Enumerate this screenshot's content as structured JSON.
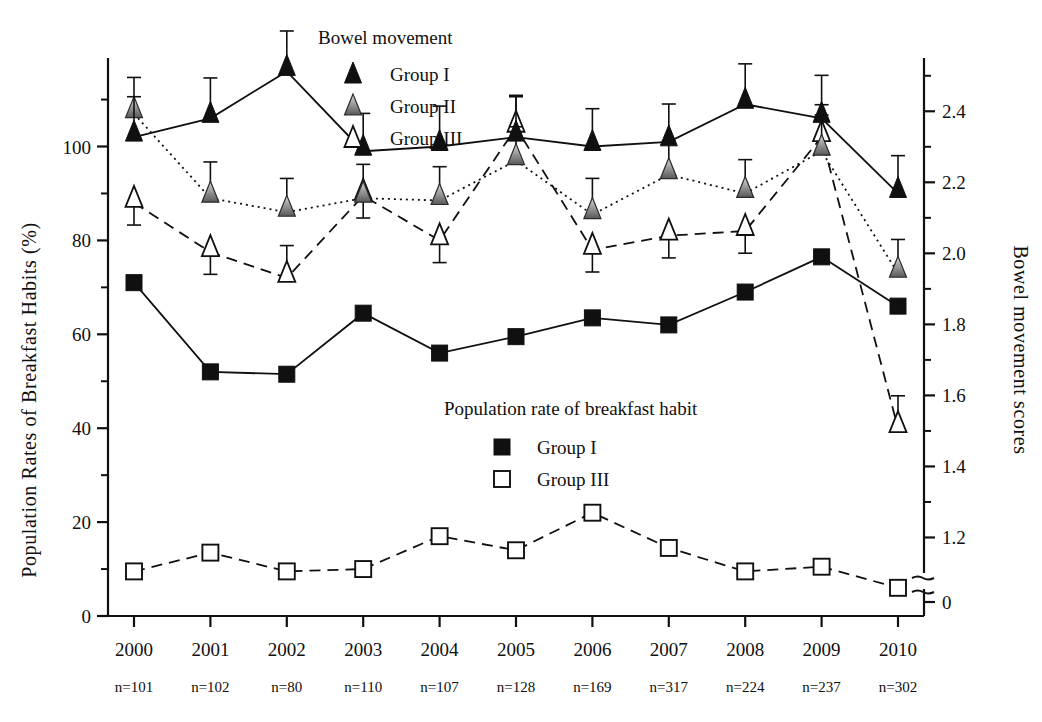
{
  "figure": {
    "y_axis_left_title": "Population Rates of Breakfast Habits (%)",
    "y_axis_right_title": "Bowel movement scores",
    "legend_top_title": "Bowel movement",
    "legend_bottom_title": "Population rate of breakfast habit"
  },
  "legend_top": [
    {
      "label": "Group I",
      "marker": "filled-triangle-icon"
    },
    {
      "label": "Group II",
      "marker": "gray-triangle-icon"
    },
    {
      "label": "Group III",
      "marker": "open-triangle-icon"
    }
  ],
  "legend_bottom": [
    {
      "label": "Group I",
      "marker": "filled-square-icon"
    },
    {
      "label": "Group III",
      "marker": "open-square-icon"
    }
  ],
  "axes": {
    "left_ticks": [
      "0",
      "20",
      "40",
      "60",
      "80",
      "100"
    ],
    "left_tick_values": [
      0,
      20,
      40,
      60,
      80,
      100
    ],
    "left_minor_values": [
      10,
      30,
      50,
      70,
      90,
      110
    ],
    "right_ticks": [
      "0",
      "1.2",
      "1.4",
      "1.6",
      "1.8",
      "2.0",
      "2.2",
      "2.4"
    ],
    "right_tick_values": [
      0,
      1.2,
      1.4,
      1.6,
      1.8,
      2.0,
      2.2,
      2.4
    ],
    "right_minor_values": [
      1.3,
      1.5,
      1.7,
      1.9,
      2.1,
      2.3,
      2.5
    ],
    "right_axis_break": true,
    "left_limits": [
      0,
      118
    ],
    "right_limits": [
      1.1,
      2.55
    ]
  },
  "chart_data": {
    "type": "line",
    "title": "",
    "xlabel": "",
    "ylabel": "Population Rates of Breakfast Habits (%)",
    "y2label": "Bowel movement scores",
    "grid": false,
    "legend_position": "inside",
    "ylim": [
      0,
      118
    ],
    "y2lim": [
      1.1,
      2.55
    ],
    "categories": [
      "2000",
      "2001",
      "2002",
      "2003",
      "2004",
      "2005",
      "2006",
      "2007",
      "2008",
      "2009",
      "2010"
    ],
    "sample_sizes": [
      "n=101",
      "n=102",
      "n=80",
      "n=110",
      "n=107",
      "n=128",
      "n=169",
      "n=317",
      "n=224",
      "n=237",
      "n=302"
    ],
    "series": [
      {
        "name": "Bowel movement Group I",
        "axis": "right",
        "marker": "filled-triangle",
        "line": "solid",
        "values_right_scale": [
          2.27,
          2.32,
          2.44,
          2.24,
          2.25,
          2.28,
          2.25,
          2.26,
          2.36,
          2.32,
          2.14
        ],
        "values_left_scale": [
          102,
          106,
          116,
          99,
          100,
          102,
          100,
          101,
          109,
          106,
          90
        ],
        "errors_left_scale": [
          9,
          9,
          9,
          8,
          9,
          9,
          8,
          8,
          9,
          10,
          8
        ]
      },
      {
        "name": "Bowel movement Group II",
        "axis": "right",
        "marker": "gray-triangle",
        "line": "dotted",
        "values_right_scale": [
          2.35,
          2.11,
          2.07,
          2.12,
          2.1,
          2.22,
          2.07,
          2.15,
          2.11,
          2.26,
          1.92
        ],
        "values_left_scale": [
          107,
          89,
          86,
          89,
          88.5,
          97,
          85.5,
          94,
          90,
          99,
          73
        ],
        "errors_left_scale": [
          8,
          8,
          7,
          7,
          7,
          7,
          8,
          7,
          7,
          8,
          7
        ]
      },
      {
        "name": "Bowel movement Group III",
        "axis": "right",
        "marker": "open-triangle",
        "line": "dashed",
        "values_right_scale": [
          2.11,
          1.98,
          1.93,
          2.12,
          2.0,
          2.33,
          1.99,
          2.01,
          2.02,
          2.28,
          1.51
        ],
        "values_left_scale": [
          88,
          77.5,
          72,
          89.5,
          80,
          104,
          78,
          81,
          82,
          102,
          40
        ],
        "errors_left_scale": [
          7,
          7,
          7,
          7,
          7,
          7,
          7,
          7,
          7,
          7,
          7
        ]
      },
      {
        "name": "Breakfast habit Group I",
        "axis": "left",
        "marker": "filled-square",
        "line": "solid",
        "values_left_scale": [
          71,
          52,
          51.5,
          64.5,
          56,
          59.5,
          63.5,
          62,
          69,
          76.5,
          66
        ]
      },
      {
        "name": "Breakfast habit Group III",
        "axis": "left",
        "marker": "open-square",
        "line": "dashed",
        "values_left_scale": [
          9.5,
          13.5,
          9.5,
          10,
          17,
          14,
          22,
          14.5,
          9.5,
          10.5,
          6
        ]
      }
    ]
  },
  "colors": {
    "ink": "#101010",
    "gray_marker_top": "#d8d8d8",
    "gray_marker_bottom": "#585858"
  }
}
